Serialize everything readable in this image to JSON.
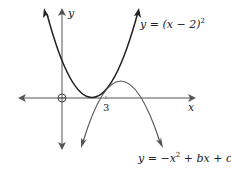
{
  "diagram": {
    "axes": {
      "x_label": "x",
      "y_label": "y",
      "origin_marker": "O",
      "tick_label": "3",
      "axis_color": "#555555"
    },
    "curves": [
      {
        "name": "upward-parabola",
        "equation": "y = (x − 2)²",
        "label_main": "y = (x − 2)",
        "label_exp": "2",
        "color": "#222222"
      },
      {
        "name": "downward-parabola",
        "equation": "y = −x² + bx + c",
        "label_pre": "y = −x",
        "label_exp": "2",
        "label_post": " + bx + c",
        "color": "#555555"
      }
    ],
    "annotations": {
      "touch_point_x": "3"
    }
  }
}
